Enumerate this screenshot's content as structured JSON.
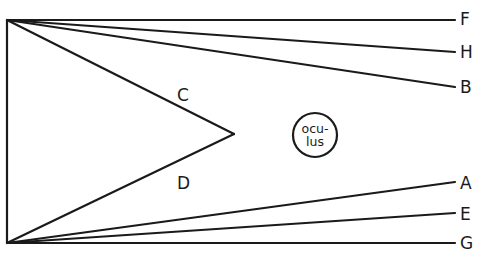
{
  "diagram": {
    "labels": {
      "F": "F",
      "H": "H",
      "B": "B",
      "C": "C",
      "D": "D",
      "A": "A",
      "E": "E",
      "G": "G"
    },
    "oculus": {
      "line1": "ocu-",
      "line2": "lus"
    },
    "points": {
      "top_apex": [
        7,
        20
      ],
      "bottom_apex": [
        7,
        243
      ],
      "vertex_CD": [
        234,
        134
      ],
      "F_end": [
        455,
        20
      ],
      "H_end": [
        455,
        52
      ],
      "B_end": [
        455,
        87
      ],
      "A_end": [
        455,
        182
      ],
      "E_end": [
        455,
        213
      ],
      "G_end": [
        455,
        243
      ],
      "oculus_center": [
        315,
        135
      ],
      "oculus_radius": 22
    },
    "line_color": "#1a1a1a"
  }
}
